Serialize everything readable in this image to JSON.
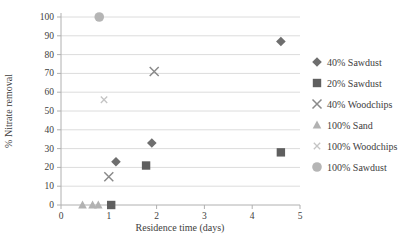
{
  "chart_data": {
    "type": "scatter",
    "title": "",
    "xlabel": "Residence time (days)",
    "ylabel": "% Nitrate removal",
    "xlim": [
      0,
      5
    ],
    "ylim": [
      0,
      100
    ],
    "x_ticks": [
      0,
      1,
      2,
      3,
      4,
      5
    ],
    "y_ticks": [
      0,
      10,
      20,
      30,
      40,
      50,
      60,
      70,
      80,
      90,
      100
    ],
    "grid": "horizontal",
    "legend_position": "right",
    "series": [
      {
        "name": "40% Sawdust",
        "marker": "diamond",
        "color": "#6e6e6e",
        "points": [
          [
            1.15,
            23
          ],
          [
            1.9,
            33
          ],
          [
            4.6,
            87
          ]
        ]
      },
      {
        "name": "20% Sawdust",
        "marker": "square",
        "color": "#5f5f5f",
        "points": [
          [
            1.05,
            0
          ],
          [
            1.78,
            21
          ],
          [
            4.6,
            28
          ]
        ]
      },
      {
        "name": "40% Woodchips",
        "marker": "x",
        "color": "#8a8a8a",
        "points": [
          [
            1.0,
            15
          ],
          [
            1.95,
            71
          ]
        ]
      },
      {
        "name": "100% Sand",
        "marker": "triangle",
        "color": "#b2b2b2",
        "points": [
          [
            0.45,
            0
          ],
          [
            0.66,
            0
          ],
          [
            0.78,
            0
          ]
        ]
      },
      {
        "name": "100% Woodchips",
        "marker": "x-small",
        "color": "#c4c4c4",
        "points": [
          [
            0.9,
            56
          ]
        ]
      },
      {
        "name": "100% Sawdust",
        "marker": "circle",
        "color": "#b5b5b5",
        "points": [
          [
            0.8,
            100
          ]
        ]
      }
    ],
    "style": {
      "gridline_color": "#dcdcdc",
      "axis_color": "#b0b0b0",
      "text_color": "#3e3e3e"
    }
  }
}
